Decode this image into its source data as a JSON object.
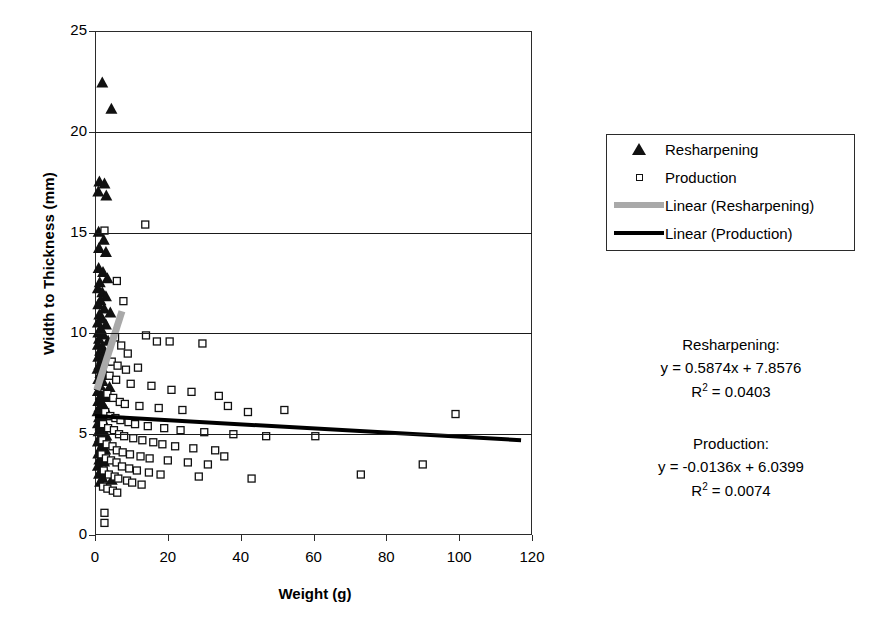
{
  "chart_data": {
    "type": "scatter",
    "title": "",
    "xlabel": "Weight (g)",
    "ylabel": "Width to Thickness (mm)",
    "xlim": [
      0,
      120
    ],
    "ylim": [
      0,
      25
    ],
    "xticks": [
      0,
      20,
      40,
      60,
      80,
      100,
      120
    ],
    "yticks": [
      0,
      5,
      10,
      15,
      20,
      25
    ],
    "grid": "horizontal",
    "legend_position": "right",
    "series": [
      {
        "name": "Resharpening",
        "marker": "filled-triangle",
        "color": "#111111",
        "points": [
          [
            2.0,
            22.4
          ],
          [
            4.5,
            21.1
          ],
          [
            1.2,
            17.5
          ],
          [
            2.6,
            17.4
          ],
          [
            0.9,
            17.0
          ],
          [
            3.1,
            16.8
          ],
          [
            1.0,
            15.0
          ],
          [
            2.4,
            14.6
          ],
          [
            1.1,
            14.2
          ],
          [
            3.0,
            14.0
          ],
          [
            1.0,
            13.2
          ],
          [
            2.2,
            13.0
          ],
          [
            3.4,
            12.7
          ],
          [
            1.3,
            12.5
          ],
          [
            0.8,
            12.2
          ],
          [
            2.0,
            12.0
          ],
          [
            3.0,
            11.8
          ],
          [
            1.5,
            11.6
          ],
          [
            0.9,
            11.4
          ],
          [
            2.5,
            11.2
          ],
          [
            4.2,
            11.0
          ],
          [
            1.2,
            10.9
          ],
          [
            2.0,
            10.7
          ],
          [
            0.8,
            10.5
          ],
          [
            3.0,
            10.4
          ],
          [
            1.6,
            10.2
          ],
          [
            0.9,
            10.0
          ],
          [
            2.3,
            9.9
          ],
          [
            1.1,
            9.7
          ],
          [
            3.6,
            9.6
          ],
          [
            0.8,
            9.4
          ],
          [
            2.0,
            9.3
          ],
          [
            1.4,
            9.1
          ],
          [
            2.8,
            9.0
          ],
          [
            0.9,
            8.8
          ],
          [
            1.9,
            8.7
          ],
          [
            3.2,
            8.6
          ],
          [
            1.2,
            8.4
          ],
          [
            0.7,
            8.2
          ],
          [
            2.4,
            8.1
          ],
          [
            1.5,
            8.0
          ],
          [
            3.0,
            7.9
          ],
          [
            0.9,
            7.7
          ],
          [
            2.1,
            7.6
          ],
          [
            1.3,
            7.4
          ],
          [
            4.0,
            7.3
          ],
          [
            0.8,
            7.1
          ],
          [
            2.6,
            7.0
          ],
          [
            1.6,
            6.9
          ],
          [
            3.3,
            6.8
          ],
          [
            0.9,
            6.6
          ],
          [
            2.0,
            6.5
          ],
          [
            1.2,
            6.3
          ],
          [
            2.9,
            6.2
          ],
          [
            0.7,
            6.1
          ],
          [
            1.8,
            6.0
          ],
          [
            3.5,
            5.9
          ],
          [
            1.1,
            5.8
          ],
          [
            2.3,
            5.6
          ],
          [
            0.8,
            5.5
          ],
          [
            1.5,
            5.4
          ],
          [
            2.7,
            5.3
          ],
          [
            1.0,
            5.1
          ],
          [
            2.0,
            5.0
          ],
          [
            3.1,
            4.9
          ],
          [
            1.3,
            4.8
          ],
          [
            0.8,
            4.6
          ],
          [
            2.2,
            4.5
          ],
          [
            1.6,
            4.3
          ],
          [
            2.8,
            4.2
          ],
          [
            0.9,
            4.0
          ],
          [
            1.9,
            3.9
          ],
          [
            1.2,
            3.7
          ],
          [
            2.5,
            3.6
          ],
          [
            0.8,
            3.4
          ],
          [
            1.7,
            3.2
          ],
          [
            3.0,
            3.1
          ],
          [
            1.1,
            3.0
          ],
          [
            2.1,
            2.8
          ],
          [
            4.6,
            2.7
          ],
          [
            1.4,
            2.6
          ]
        ]
      },
      {
        "name": "Production",
        "marker": "open-square",
        "color": "#111111",
        "points": [
          [
            2.6,
            15.1
          ],
          [
            13.8,
            15.4
          ],
          [
            6.0,
            12.6
          ],
          [
            7.8,
            11.6
          ],
          [
            14.0,
            9.9
          ],
          [
            17.0,
            9.6
          ],
          [
            20.5,
            9.6
          ],
          [
            29.5,
            9.5
          ],
          [
            5.5,
            9.8
          ],
          [
            7.2,
            9.4
          ],
          [
            9.0,
            9.0
          ],
          [
            4.6,
            8.6
          ],
          [
            6.2,
            8.4
          ],
          [
            8.5,
            8.2
          ],
          [
            11.8,
            8.3
          ],
          [
            4.0,
            7.9
          ],
          [
            5.8,
            7.7
          ],
          [
            9.8,
            7.5
          ],
          [
            15.5,
            7.4
          ],
          [
            21.0,
            7.2
          ],
          [
            26.5,
            7.1
          ],
          [
            34.0,
            6.9
          ],
          [
            3.4,
            7.0
          ],
          [
            5.0,
            6.8
          ],
          [
            6.8,
            6.6
          ],
          [
            8.2,
            6.5
          ],
          [
            12.2,
            6.4
          ],
          [
            17.5,
            6.3
          ],
          [
            24.0,
            6.2
          ],
          [
            36.5,
            6.4
          ],
          [
            42.0,
            6.1
          ],
          [
            52.0,
            6.2
          ],
          [
            99.0,
            6.0
          ],
          [
            2.8,
            6.1
          ],
          [
            4.2,
            5.9
          ],
          [
            5.6,
            5.8
          ],
          [
            7.0,
            5.7
          ],
          [
            9.2,
            5.6
          ],
          [
            11.0,
            5.5
          ],
          [
            14.5,
            5.4
          ],
          [
            19.0,
            5.3
          ],
          [
            23.5,
            5.2
          ],
          [
            30.0,
            5.1
          ],
          [
            38.0,
            5.0
          ],
          [
            47.0,
            4.9
          ],
          [
            60.5,
            4.9
          ],
          [
            2.2,
            5.5
          ],
          [
            3.6,
            5.3
          ],
          [
            5.2,
            5.2
          ],
          [
            6.6,
            5.0
          ],
          [
            8.0,
            4.9
          ],
          [
            10.5,
            4.8
          ],
          [
            13.0,
            4.7
          ],
          [
            16.0,
            4.6
          ],
          [
            18.5,
            4.5
          ],
          [
            22.0,
            4.4
          ],
          [
            27.0,
            4.3
          ],
          [
            33.0,
            4.2
          ],
          [
            2.0,
            4.7
          ],
          [
            3.2,
            4.5
          ],
          [
            4.8,
            4.4
          ],
          [
            6.0,
            4.2
          ],
          [
            7.6,
            4.1
          ],
          [
            9.6,
            4.0
          ],
          [
            12.5,
            3.9
          ],
          [
            15.0,
            3.8
          ],
          [
            20.0,
            3.7
          ],
          [
            25.5,
            3.6
          ],
          [
            31.0,
            3.5
          ],
          [
            35.5,
            3.9
          ],
          [
            90.0,
            3.5
          ],
          [
            1.8,
            4.0
          ],
          [
            3.0,
            3.8
          ],
          [
            4.4,
            3.7
          ],
          [
            5.9,
            3.6
          ],
          [
            7.4,
            3.4
          ],
          [
            9.4,
            3.3
          ],
          [
            11.5,
            3.2
          ],
          [
            14.8,
            3.1
          ],
          [
            18.0,
            3.0
          ],
          [
            28.5,
            2.9
          ],
          [
            43.0,
            2.8
          ],
          [
            73.0,
            3.0
          ],
          [
            2.4,
            3.2
          ],
          [
            3.8,
            3.0
          ],
          [
            5.4,
            2.9
          ],
          [
            6.4,
            2.8
          ],
          [
            8.8,
            2.7
          ],
          [
            10.2,
            2.6
          ],
          [
            12.8,
            2.5
          ],
          [
            2.2,
            2.4
          ],
          [
            3.4,
            2.3
          ],
          [
            4.9,
            2.2
          ],
          [
            6.1,
            2.1
          ],
          [
            2.6,
            1.1
          ],
          [
            2.6,
            0.6
          ]
        ]
      }
    ],
    "trendlines": [
      {
        "name": "Linear (Resharpening)",
        "color": "#a9a9a9",
        "width": 7,
        "equation": "y = 0.5874x + 7.8576",
        "r_squared": "R2 = 0.0403",
        "x_from": 0.5,
        "x_to": 7.4,
        "y_from": 7.2,
        "y_to": 11.1
      },
      {
        "name": "Linear (Production)",
        "color": "#000000",
        "width": 4,
        "equation": "y = -0.0136x + 6.0399",
        "r_squared": "R2 = 0.0074",
        "x_from": 0.0,
        "x_to": 117.0,
        "y_from": 5.9,
        "y_to": 4.7
      }
    ]
  },
  "axes": {
    "y_tick_labels": [
      "25",
      "20",
      "15",
      "10",
      "5",
      "0"
    ],
    "x_tick_labels": [
      "0",
      "20",
      "40",
      "60",
      "80",
      "100",
      "120"
    ],
    "y_title": "Width to Thickness (mm)",
    "x_title": "Weight (g)"
  },
  "legend": {
    "items": [
      {
        "label": "Resharpening",
        "key": "filled-triangle-marker"
      },
      {
        "label": "Production",
        "key": "open-square-marker"
      },
      {
        "label": "Linear (Resharpening)",
        "key": "gray-line-swatch"
      },
      {
        "label": "Linear (Production)",
        "key": "black-line-swatch"
      }
    ]
  },
  "annotations": {
    "resharpening": {
      "heading": "Resharpening:",
      "equation": "y = 0.5874x + 7.8576",
      "r_prefix": "R",
      "r_exp": "2",
      "r_value": " = 0.0403"
    },
    "production": {
      "heading": "Production:",
      "equation": "y = -0.0136x + 6.0399",
      "r_prefix": "R",
      "r_exp": "2",
      "r_value": " = 0.0074"
    }
  }
}
